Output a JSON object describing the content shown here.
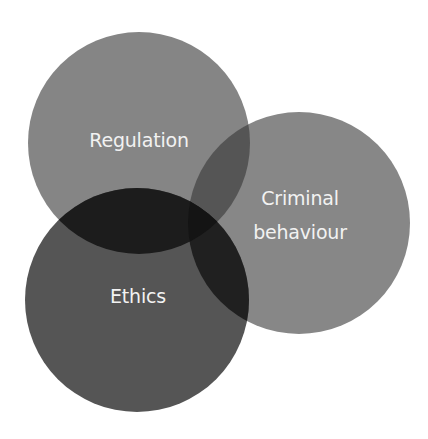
{
  "diagram": {
    "type": "venn",
    "sets": [
      {
        "id": "regulation",
        "label": "Regulation",
        "color": "#858585",
        "cx": 139,
        "cy": 143,
        "r": 111
      },
      {
        "id": "criminal",
        "label_line1": "Criminal",
        "label_line2": "behaviour",
        "color": "#878787",
        "cx": 299,
        "cy": 223,
        "r": 111
      },
      {
        "id": "ethics",
        "label": "Ethics",
        "color": "#555555",
        "cx": 137,
        "cy": 300,
        "r": 112
      }
    ],
    "overlap_colors": {
      "regulation_ethics": "#1c1c1c",
      "regulation_criminal": "#555555",
      "ethics_criminal": "#202020",
      "all_three": "#141414"
    },
    "label_color": "#f2f2f2"
  }
}
